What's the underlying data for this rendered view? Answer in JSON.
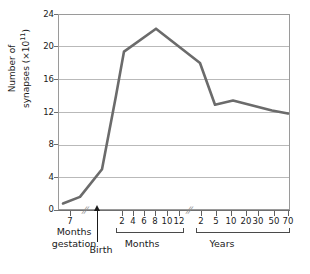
{
  "chart_data": {
    "type": "line",
    "title": "",
    "xlabel": "",
    "ylabel": "Number of synapses (×10¹¹)",
    "ylim": [
      0,
      24
    ],
    "grid": true,
    "legend": null,
    "y_ticks": [
      {
        "value": 24,
        "label": "24"
      },
      {
        "value": 20,
        "label": "20"
      },
      {
        "value": 16,
        "label": "16"
      },
      {
        "value": 12,
        "label": "12"
      },
      {
        "value": 8,
        "label": "8"
      },
      {
        "value": 4,
        "label": "4"
      },
      {
        "value": 0,
        "label": "0"
      }
    ],
    "x_axis_segments": [
      {
        "name": "gestation",
        "caption": "Months gestation",
        "unit": "months gestation",
        "ticks": [
          {
            "label": "7",
            "px": 70
          }
        ]
      },
      {
        "name": "months",
        "caption": "Months",
        "unit": "months after birth",
        "ticks": [
          {
            "label": "2",
            "px": 122
          },
          {
            "label": "4",
            "px": 133
          },
          {
            "label": "6",
            "px": 144
          },
          {
            "label": "8",
            "px": 155
          },
          {
            "label": "10",
            "px": 167
          },
          {
            "label": "12",
            "px": 179
          }
        ]
      },
      {
        "name": "years",
        "caption": "Years",
        "unit": "years",
        "ticks": [
          {
            "label": "2",
            "px": 201
          },
          {
            "label": "5",
            "px": 216
          },
          {
            "label": "10",
            "px": 231
          },
          {
            "label": "20",
            "px": 246
          },
          {
            "label": "30",
            "px": 258
          },
          {
            "label": "50",
            "px": 274
          },
          {
            "label": "70",
            "px": 288
          }
        ]
      }
    ],
    "birth_marker": {
      "label": "Birth",
      "px": 97
    },
    "axis_breaks_px": [
      85,
      190
    ],
    "series": [
      {
        "name": "Number of synapses",
        "color": "#6b6b6b",
        "points": [
          {
            "x_label": "7 months gestation",
            "px": 63,
            "value": 0.8
          },
          {
            "x_label": "birth",
            "px": 80,
            "value": 1.6
          },
          {
            "x_label": "1 month",
            "px": 102,
            "value": 5.0
          },
          {
            "x_label": "2 months",
            "px": 116,
            "value": 14.0
          },
          {
            "x_label": "3 months",
            "px": 124,
            "value": 19.4
          },
          {
            "x_label": "8 months",
            "px": 156,
            "value": 22.2
          },
          {
            "x_label": "2 years",
            "px": 200,
            "value": 18.0
          },
          {
            "x_label": "5 years",
            "px": 215,
            "value": 12.9
          },
          {
            "x_label": "10 years",
            "px": 233,
            "value": 13.4
          },
          {
            "x_label": "50 years",
            "px": 272,
            "value": 12.2
          },
          {
            "x_label": "70 years",
            "px": 288,
            "value": 11.8
          }
        ]
      }
    ]
  },
  "labels": {
    "y_axis_title_main": "Number of",
    "y_axis_title_sub": "synapses (×10",
    "y_axis_exponent": "11",
    "y_axis_title_close": ")"
  }
}
